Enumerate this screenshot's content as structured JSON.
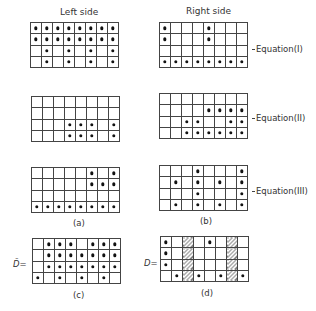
{
  "headers": {
    "left": "Left side",
    "right": "Right side"
  },
  "equations": [
    {
      "label": "Equation(I)",
      "left": [
        [
          1,
          1,
          1,
          1,
          1,
          1,
          1,
          1
        ],
        [
          1,
          1,
          1,
          1,
          1,
          1,
          1,
          1
        ],
        [
          0,
          1,
          0,
          1,
          0,
          1,
          0,
          1
        ],
        [
          0,
          1,
          0,
          1,
          0,
          1,
          0,
          1
        ]
      ],
      "right": [
        [
          1,
          0,
          0,
          0,
          1,
          0,
          0,
          0
        ],
        [
          1,
          0,
          0,
          0,
          1,
          0,
          0,
          0
        ],
        [
          0,
          0,
          0,
          0,
          0,
          0,
          0,
          0
        ],
        [
          1,
          1,
          1,
          1,
          1,
          1,
          1,
          1
        ]
      ]
    },
    {
      "label": "Equation(II)",
      "left": [
        [
          0,
          0,
          0,
          0,
          0,
          0,
          0,
          0
        ],
        [
          0,
          0,
          0,
          0,
          0,
          0,
          0,
          0
        ],
        [
          0,
          0,
          0,
          1,
          1,
          1,
          0,
          1
        ],
        [
          0,
          0,
          0,
          1,
          1,
          1,
          0,
          1
        ]
      ],
      "right": [
        [
          0,
          0,
          0,
          0,
          0,
          0,
          0,
          0
        ],
        [
          0,
          0,
          0,
          0,
          1,
          1,
          1,
          1
        ],
        [
          0,
          0,
          1,
          1,
          0,
          0,
          1,
          1
        ],
        [
          0,
          0,
          1,
          1,
          1,
          1,
          1,
          1
        ]
      ]
    },
    {
      "label": "Equation(III)",
      "left": [
        [
          0,
          0,
          0,
          0,
          0,
          1,
          0,
          1
        ],
        [
          0,
          0,
          0,
          0,
          0,
          1,
          1,
          1
        ],
        [
          0,
          0,
          0,
          0,
          0,
          0,
          0,
          0
        ],
        [
          1,
          1,
          1,
          1,
          1,
          1,
          1,
          1
        ]
      ],
      "right": [
        [
          0,
          0,
          0,
          1,
          0,
          0,
          0,
          1
        ],
        [
          0,
          1,
          0,
          1,
          0,
          1,
          0,
          1
        ],
        [
          0,
          0,
          0,
          1,
          0,
          0,
          0,
          1
        ],
        [
          0,
          1,
          0,
          1,
          0,
          1,
          0,
          1
        ]
      ]
    }
  ],
  "column_labels": {
    "a": "(a)",
    "b": "(b)"
  },
  "matrix_c": {
    "symbol": "D̄=",
    "caption": "(c)",
    "cells": [
      [
        0,
        1,
        1,
        1,
        0,
        1,
        1,
        1
      ],
      [
        0,
        1,
        1,
        1,
        1,
        1,
        1,
        1
      ],
      [
        0,
        1,
        1,
        1,
        1,
        1,
        1,
        1
      ],
      [
        1,
        0,
        1,
        0,
        1,
        0,
        1,
        0
      ]
    ]
  },
  "matrix_d": {
    "symbol": "D=",
    "caption": "(d)",
    "hatched_columns": [
      3,
      7
    ],
    "cells": [
      [
        1,
        0,
        0,
        0,
        1,
        0,
        0,
        0
      ],
      [
        1,
        0,
        0,
        0,
        0,
        0,
        0,
        0
      ],
      [
        1,
        0,
        0,
        0,
        0,
        0,
        0,
        0
      ],
      [
        0,
        1,
        0,
        1,
        0,
        1,
        0,
        1
      ]
    ]
  }
}
